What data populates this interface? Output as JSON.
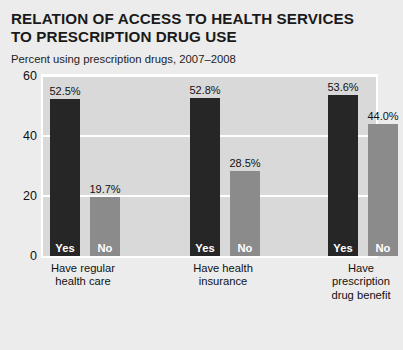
{
  "title": {
    "line1": "RELATION OF ACCESS TO HEALTH SERVICES",
    "line2": "TO PRESCRIPTION DRUG USE"
  },
  "subtitle": "Percent using prescription drugs, 2007–2008",
  "chart_data": {
    "type": "bar",
    "title": "RELATION OF ACCESS TO HEALTH SERVICES TO PRESCRIPTION DRUG USE",
    "subtitle": "Percent using prescription drugs, 2007–2008",
    "xlabel": "",
    "ylabel": "",
    "ylim": [
      0,
      60
    ],
    "yticks": [
      0,
      20,
      40,
      60
    ],
    "ytick_labels": [
      "0",
      "20",
      "40",
      "60"
    ],
    "grid": true,
    "legend": "none",
    "categories": [
      "Have regular health care",
      "Have health insurance",
      "Have prescription drug benefit"
    ],
    "category_lines": [
      [
        "Have regular",
        "health care"
      ],
      [
        "Have health",
        "insurance"
      ],
      [
        "Have",
        "prescription",
        "drug benefit"
      ]
    ],
    "series": [
      {
        "name": "Yes",
        "color": "#262626",
        "values": [
          52.5,
          52.8,
          53.6
        ],
        "value_labels": [
          "52.5%",
          "52.8%",
          "53.6%"
        ]
      },
      {
        "name": "No",
        "color": "#8b8b8b",
        "values": [
          19.7,
          28.5,
          44.0
        ],
        "value_labels": [
          "19.7%",
          "28.5%",
          "44.0%"
        ]
      }
    ],
    "bars": [
      {
        "group": 0,
        "series": "Yes",
        "label": "Yes",
        "value": 52.5,
        "value_label": "52.5%",
        "color": "#262626"
      },
      {
        "group": 0,
        "series": "No",
        "label": "No",
        "value": 19.7,
        "value_label": "19.7%",
        "color": "#8b8b8b"
      },
      {
        "group": 1,
        "series": "Yes",
        "label": "Yes",
        "value": 52.8,
        "value_label": "52.8%",
        "color": "#262626"
      },
      {
        "group": 1,
        "series": "No",
        "label": "No",
        "value": 28.5,
        "value_label": "28.5%",
        "color": "#8b8b8b"
      },
      {
        "group": 2,
        "series": "Yes",
        "label": "Yes",
        "value": 53.6,
        "value_label": "53.6%",
        "color": "#262626"
      },
      {
        "group": 2,
        "series": "No",
        "label": "No",
        "value": 44.0,
        "value_label": "44.0%",
        "color": "#8b8b8b"
      }
    ]
  },
  "colors": {
    "background": "#ececec",
    "plot_background": "#d9d9d9",
    "gridline": "#ffffff",
    "bar_yes": "#262626",
    "bar_no": "#8b8b8b",
    "text": "#111111"
  }
}
